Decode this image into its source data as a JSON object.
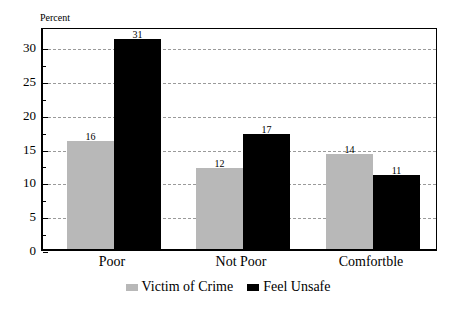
{
  "chart_data": {
    "type": "bar",
    "title": "",
    "ylabel": "Percent",
    "xlabel": "",
    "categories": [
      "Poor",
      "Not Poor",
      "Comfortble"
    ],
    "series": [
      {
        "name": "Victim of Crime",
        "color": "#b8b8b8",
        "values": [
          16,
          12,
          14
        ]
      },
      {
        "name": "Feel Unsafe",
        "color": "#000000",
        "values": [
          31,
          17,
          11
        ]
      }
    ],
    "ylim": [
      0,
      33
    ],
    "yticks": [
      0,
      5,
      10,
      15,
      20,
      25,
      30
    ],
    "grid": true,
    "legend_position": "bottom"
  },
  "labels": {
    "y_title": "Percent",
    "yticks": [
      "0",
      "5",
      "10",
      "15",
      "20",
      "25",
      "30"
    ],
    "categories": [
      "Poor",
      "Not Poor",
      "Comfortble"
    ],
    "values_victim": [
      "16",
      "12",
      "14"
    ],
    "values_unsafe": [
      "31",
      "17",
      "11"
    ],
    "legend": [
      "Victim of Crime",
      "Feel Unsafe"
    ]
  }
}
